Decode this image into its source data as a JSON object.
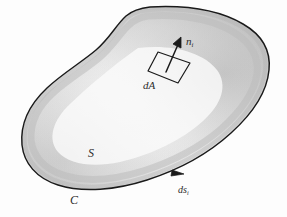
{
  "figure": {
    "kind": "vector-calculus-surface-diagram",
    "background_color": "#fdfdfd",
    "ink_color": "#1a1a1a",
    "label_color": "#2b2b2b",
    "surface": {
      "name": "S",
      "label": "S",
      "description": "closed bean-shaped oriented surface with shaded interior",
      "fill_light": "#f2f2f2",
      "fill_mid": "#dcdcdc",
      "fill_dark": "#bdbdbd",
      "outline_width_px": 1.4
    },
    "boundary": {
      "name": "C",
      "label": "C",
      "description": "closed boundary curve of the surface"
    },
    "arc_element": {
      "label_main": "ds",
      "label_sub": "i",
      "description": "directed line element along boundary curve C",
      "arrow_direction": "counter-clockwise"
    },
    "area_element": {
      "label": "dA",
      "description": "infinitesimal parallelogram patch of area on the surface"
    },
    "normal_vector": {
      "label_main": "n",
      "label_sub": "i",
      "description": "unit normal vector to the area element dA"
    }
  }
}
